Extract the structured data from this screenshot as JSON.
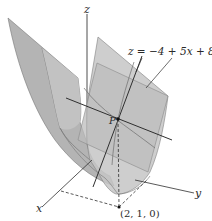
{
  "figure": {
    "equation_label": "z = −4 + 5x + 8y",
    "axes": {
      "x": "x",
      "y": "y",
      "z": "z"
    },
    "point_label": "P",
    "base_point_label": "(2, 1, 0)"
  },
  "colors": {
    "surface_fill": "#b9b9b9",
    "surface_dark": "#9d9d9d",
    "plane_fill": "#c8c8c8",
    "line": "#2f2f2f",
    "background": "#ffffff"
  }
}
